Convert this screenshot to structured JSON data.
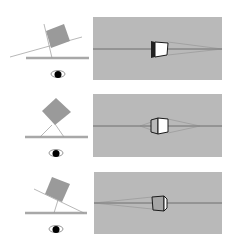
{
  "figure": {
    "colors": {
      "background": "#ffffff",
      "panel": "#b9b9b9",
      "box_plan": "#9a9a9a",
      "ground": "#a8a8a8",
      "horizon": "#6f6f6f",
      "outline": "#1a1a1a",
      "face_light": "#ffffff",
      "face_gray": "#a6a6a6",
      "sightline": "#8a8a8a",
      "eye": "#000000"
    },
    "rows": [
      {
        "name": "row-1",
        "plan": {
          "box_rotation_deg": -20,
          "eye_icon": "eye-icon"
        },
        "view": {
          "front_face": "light",
          "side_visible": "left"
        }
      },
      {
        "name": "row-2",
        "plan": {
          "box_rotation_deg": 45,
          "eye_icon": "eye-icon"
        },
        "view": {
          "front_face": "light",
          "side_visible": "left"
        }
      },
      {
        "name": "row-3",
        "plan": {
          "box_rotation_deg": 30,
          "eye_icon": "eye-icon"
        },
        "view": {
          "front_face": "gray",
          "side_visible": "right"
        }
      }
    ]
  }
}
